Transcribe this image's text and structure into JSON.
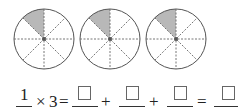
{
  "figure": {
    "circles": [
      {
        "parts": 8,
        "shaded": 1
      },
      {
        "parts": 8,
        "shaded": 1
      },
      {
        "parts": 8,
        "shaded": 1
      }
    ],
    "colors": {
      "shade": "#b8b8b8",
      "stroke": "#555555",
      "dash": "#666666"
    }
  },
  "equation": {
    "fraction_numerator": "1",
    "times": "×",
    "multiplier": "3",
    "equals": "=",
    "plus": "+",
    "blank_count": 4
  }
}
